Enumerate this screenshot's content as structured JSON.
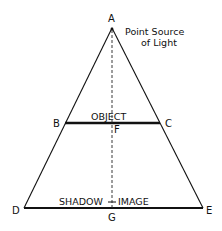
{
  "diagram": {
    "points": {
      "A": {
        "label": "A",
        "x": 112,
        "y": 28
      },
      "B": {
        "label": "B",
        "x": 65,
        "y": 123
      },
      "C": {
        "label": "C",
        "x": 160,
        "y": 123
      },
      "D": {
        "label": "D",
        "x": 24,
        "y": 208
      },
      "E": {
        "label": "E",
        "x": 203,
        "y": 208
      },
      "F": {
        "label": "F",
        "x": 112,
        "y": 123
      },
      "G": {
        "label": "G",
        "x": 112,
        "y": 208
      }
    },
    "annotations": {
      "source_line1": "Point Source",
      "source_line2": "of Light",
      "object": "OBJECT",
      "shadow_left": "SHADOW",
      "shadow_right": "IMAGE"
    },
    "colors": {
      "stroke": "#111111",
      "background": "#ffffff"
    }
  }
}
